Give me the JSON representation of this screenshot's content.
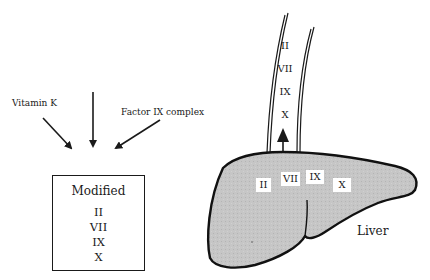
{
  "left_panel": {
    "inputs": [
      {
        "label": "Vitamin K",
        "arrow": "diagonal-from-left"
      },
      {
        "label": "",
        "arrow": "vertical-from-top"
      },
      {
        "label": "Factor IX complex",
        "arrow": "diagonal-from-right"
      }
    ],
    "box": {
      "title": "Modified",
      "factors": [
        "II",
        "VII",
        "IX",
        "X"
      ]
    }
  },
  "right_panel": {
    "vessel": {
      "factors": [
        "II",
        "VII",
        "IX",
        "X"
      ],
      "flow_direction": "up"
    },
    "liver": {
      "label": "Liver",
      "fill_color": "#c4c4c4",
      "factors": [
        "II",
        "VII",
        "IX",
        "X"
      ]
    }
  }
}
